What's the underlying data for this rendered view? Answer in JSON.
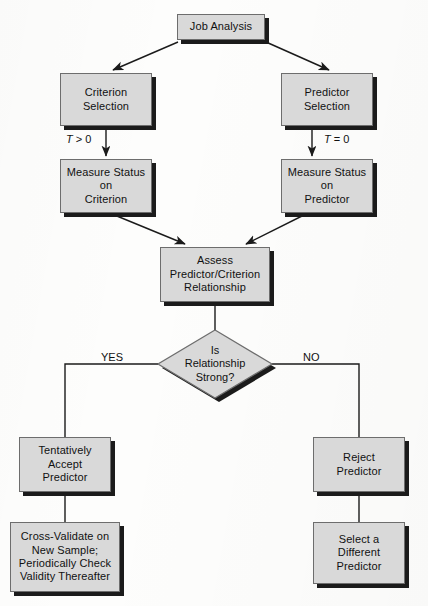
{
  "diagram": {
    "palette": {
      "node_fill": "#d9d9d9",
      "node_border": "#6d6d6d",
      "node_shadow": "#1b1b1b",
      "line": "#1b1b1b",
      "text": "#111111",
      "background": "#fdfdfc"
    },
    "nodes": [
      {
        "id": "job-analysis",
        "label": "Job Analysis",
        "shape": "rect",
        "x": 177,
        "y": 14,
        "w": 88,
        "h": 26
      },
      {
        "id": "criterion-selection",
        "label": "Criterion\nSelection",
        "shape": "rect",
        "x": 60,
        "y": 73,
        "w": 92,
        "h": 53
      },
      {
        "id": "predictor-selection",
        "label": "Predictor\nSelection",
        "shape": "rect",
        "x": 281,
        "y": 73,
        "w": 92,
        "h": 53
      },
      {
        "id": "measure-criterion",
        "label": "Measure Status\non\nCriterion",
        "shape": "rect",
        "x": 60,
        "y": 159,
        "w": 92,
        "h": 54
      },
      {
        "id": "measure-predictor",
        "label": "Measure Status\non\nPredictor",
        "shape": "rect",
        "x": 281,
        "y": 159,
        "w": 92,
        "h": 54
      },
      {
        "id": "assess-relationship",
        "label": "Assess\nPredictor/Criterion\nRelationship",
        "shape": "rect",
        "x": 160,
        "y": 247,
        "w": 110,
        "h": 55
      },
      {
        "id": "is-relationship-strong",
        "label": "Is\nRelationship\nStrong?",
        "shape": "diamond",
        "x": 158,
        "y": 330,
        "w": 114,
        "h": 68
      },
      {
        "id": "tentatively-accept",
        "label": "Tentatively\nAccept\nPredictor",
        "shape": "rect",
        "x": 19,
        "y": 437,
        "w": 92,
        "h": 55
      },
      {
        "id": "cross-validate",
        "label": "Cross-Validate on\nNew Sample;\nPeriodically Check\nValidity Thereafter",
        "shape": "rect",
        "x": 10,
        "y": 522,
        "w": 110,
        "h": 70
      },
      {
        "id": "reject-predictor",
        "label": "Reject\nPredictor",
        "shape": "rect",
        "x": 313,
        "y": 437,
        "w": 92,
        "h": 55
      },
      {
        "id": "select-different",
        "label": "Select a\nDifferent\nPredictor",
        "shape": "rect",
        "x": 313,
        "y": 522,
        "w": 92,
        "h": 62
      }
    ],
    "edge_labels": [
      {
        "id": "t-greater-zero",
        "text": "T > 0",
        "var": "T",
        "rel": " > 0",
        "x": 70,
        "y": 134
      },
      {
        "id": "t-equals-zero",
        "text": "T = 0",
        "var": "T",
        "rel": " = 0",
        "x": 324,
        "y": 134
      },
      {
        "id": "yes-label",
        "text": "YES",
        "x": 101,
        "y": 352
      },
      {
        "id": "no-label",
        "text": "NO",
        "x": 303,
        "y": 352
      }
    ],
    "edges": [
      {
        "id": "job-to-criterion",
        "from": "job-analysis",
        "to": "criterion-selection",
        "type": "arrow-diagonal"
      },
      {
        "id": "job-to-predictor",
        "from": "job-analysis",
        "to": "predictor-selection",
        "type": "arrow-diagonal"
      },
      {
        "id": "criterion-to-measure",
        "from": "criterion-selection",
        "to": "measure-criterion",
        "type": "arrow-vertical",
        "label": "T > 0"
      },
      {
        "id": "predictor-to-measure",
        "from": "predictor-selection",
        "to": "measure-predictor",
        "type": "arrow-vertical",
        "label": "T = 0"
      },
      {
        "id": "measurec-to-assess",
        "from": "measure-criterion",
        "to": "assess-relationship",
        "type": "arrow-diagonal"
      },
      {
        "id": "measurep-to-assess",
        "from": "measure-predictor",
        "to": "assess-relationship",
        "type": "arrow-diagonal"
      },
      {
        "id": "assess-to-decision",
        "from": "assess-relationship",
        "to": "is-relationship-strong",
        "type": "line-vertical"
      },
      {
        "id": "decision-yes",
        "from": "is-relationship-strong",
        "to": "tentatively-accept",
        "type": "elbow-left",
        "label": "YES"
      },
      {
        "id": "decision-no",
        "from": "is-relationship-strong",
        "to": "reject-predictor",
        "type": "elbow-right",
        "label": "NO"
      },
      {
        "id": "accept-to-validate",
        "from": "tentatively-accept",
        "to": "cross-validate",
        "type": "line-vertical"
      },
      {
        "id": "reject-to-select",
        "from": "reject-predictor",
        "to": "select-different",
        "type": "line-vertical"
      }
    ]
  }
}
